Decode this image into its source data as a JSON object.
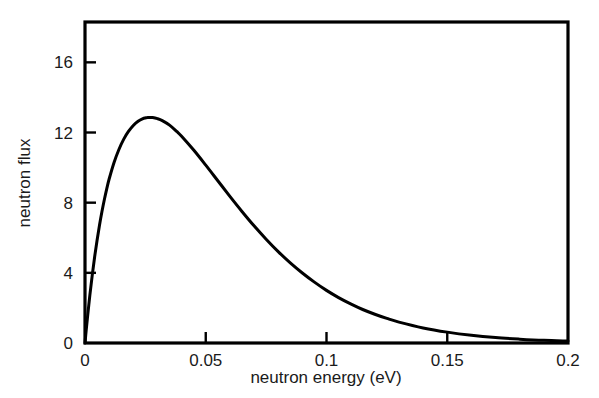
{
  "chart_data": {
    "type": "line",
    "title": "",
    "subtitle": "",
    "xlabel": "neutron energy (eV)",
    "ylabel": "neutron flux",
    "xlim": [
      0,
      0.2
    ],
    "ylim": [
      0,
      18.3
    ],
    "xticks": [
      0,
      0.05,
      0.1,
      0.15,
      0.2
    ],
    "xticklabels": [
      "0",
      "0.05",
      "0.1",
      "0.15",
      "0.2"
    ],
    "yticks": [
      0,
      4,
      8,
      12,
      16
    ],
    "yticklabels": [
      "0",
      "4",
      "8",
      "12",
      "16"
    ],
    "grid": false,
    "legend": null,
    "annotations": [],
    "series": [
      {
        "name": "Maxwellian neutron flux",
        "color": "#000000",
        "linewidth": 3,
        "description": "Maxwell-Boltzmann thermal neutron flux distribution, peak flux 14.5 at 0.025 eV",
        "x": [
          0,
          0.0005,
          0.001,
          0.002,
          0.003,
          0.004,
          0.005,
          0.006,
          0.007,
          0.008,
          0.009,
          0.01,
          0.012,
          0.014,
          0.016,
          0.018,
          0.02,
          0.022,
          0.024,
          0.025,
          0.026,
          0.028,
          0.03,
          0.032,
          0.035,
          0.038,
          0.04,
          0.045,
          0.05,
          0.055,
          0.06,
          0.065,
          0.07,
          0.075,
          0.08,
          0.085,
          0.09,
          0.095,
          0.1,
          0.105,
          0.11,
          0.115,
          0.12,
          0.125,
          0.13,
          0.14,
          0.15,
          0.16,
          0.17,
          0.18,
          0.19,
          0.2
        ],
        "y": [
          0,
          0.73,
          1.42,
          2.71,
          3.87,
          4.92,
          5.86,
          6.71,
          7.48,
          8.17,
          8.79,
          9.35,
          10.28,
          11.02,
          11.61,
          12.06,
          12.4,
          12.64,
          12.79,
          12.83,
          12.86,
          12.85,
          12.79,
          12.68,
          12.42,
          12.06,
          11.79,
          11.0,
          10.14,
          9.25,
          8.36,
          7.5,
          6.68,
          5.92,
          5.21,
          4.57,
          3.99,
          3.47,
          3.0,
          2.59,
          2.23,
          1.91,
          1.64,
          1.4,
          1.19,
          0.86,
          0.62,
          0.44,
          0.31,
          0.22,
          0.15,
          0.11
        ],
        "peak": {
          "x": 0.025,
          "y": 14.5
        }
      }
    ]
  },
  "axes": {
    "x_tick_labels": [
      "0",
      "0.05",
      "0.1",
      "0.15",
      "0.2"
    ],
    "y_tick_labels": [
      "0",
      "4",
      "8",
      "12",
      "16"
    ],
    "x_axis_title": "neutron energy (eV)",
    "y_axis_title": "neutron flux"
  },
  "style": {
    "line_color": "#000000",
    "axis_color": "#000000",
    "background": "#ffffff",
    "text_color": "#1a1a1a"
  }
}
